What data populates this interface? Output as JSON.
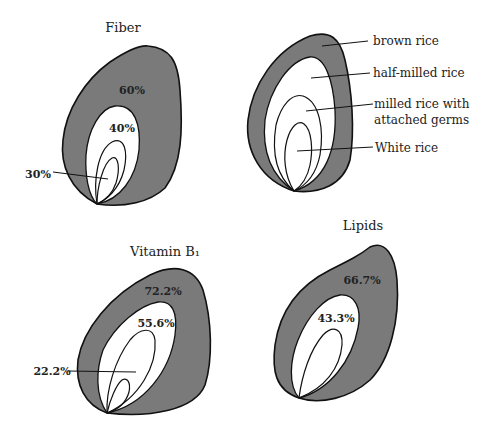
{
  "diagrams": [
    {
      "title": "Fiber",
      "labels": [
        "60%",
        "40%",
        "30%"
      ]
    },
    {
      "title": "",
      "legend": [
        "brown rice",
        "half-milled rice",
        "milled rice with",
        "attached germs",
        "White rice"
      ]
    },
    {
      "title": "Vitamin B₁",
      "labels": [
        "72.2%",
        "55.6%",
        "22.2%"
      ]
    },
    {
      "title": "Lipids",
      "labels": [
        "66.7%",
        "43.3%"
      ]
    }
  ],
  "colors": {
    "shell": "#7a7a7a",
    "inner": "#ffffff",
    "outline": "#111111"
  }
}
